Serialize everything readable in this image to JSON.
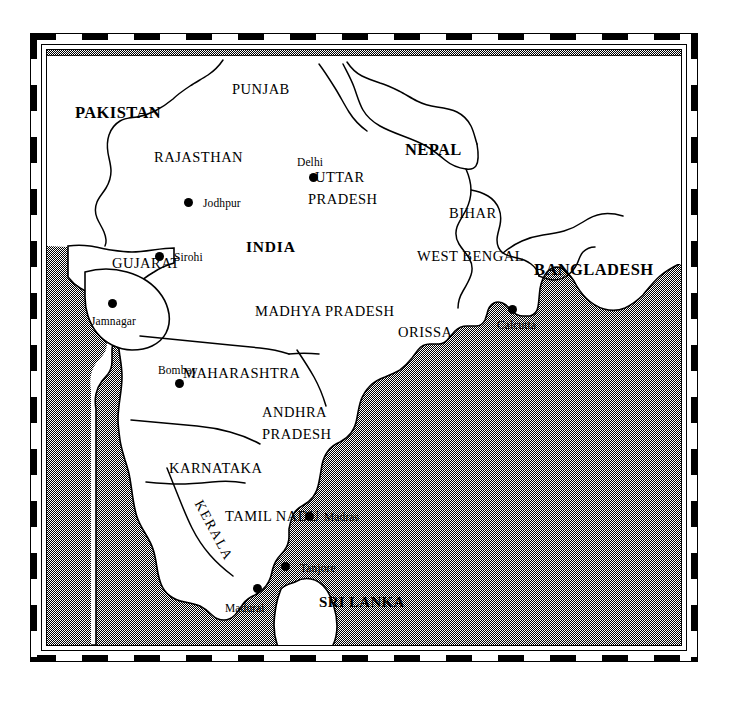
{
  "map": {
    "title": "Map of the Indian Subcontinent",
    "sea_fill_hex": "#808080",
    "land_fill_hex": "#ffffff",
    "outline_hex": "#000000",
    "frame_hex": "#000000",
    "countries": [
      {
        "name": "PAKISTAN",
        "x": 28,
        "y": 55,
        "style": "country"
      },
      {
        "name": "NEPAL",
        "x": 358,
        "y": 92,
        "style": "country"
      },
      {
        "name": "BANGLADESH",
        "x": 487,
        "y": 212,
        "style": "country"
      },
      {
        "name": "SRI LANKA",
        "x": 272,
        "y": 545,
        "style": "country-sm"
      },
      {
        "name": "INDIA",
        "x": 199,
        "y": 189,
        "style": "india"
      }
    ],
    "states": [
      {
        "name": "PUNJAB",
        "x": 185,
        "y": 32
      },
      {
        "name": "RAJASTHAN",
        "x": 107,
        "y": 100
      },
      {
        "name": "UTTAR",
        "x": 268,
        "y": 120
      },
      {
        "name": "PRADESH",
        "x": 261,
        "y": 142
      },
      {
        "name": "BIHAR",
        "x": 402,
        "y": 156
      },
      {
        "name": "WEST BENGAL",
        "x": 370,
        "y": 199
      },
      {
        "name": "GUJARAT",
        "x": 65,
        "y": 206
      },
      {
        "name": "MADHYA PRADESH",
        "x": 208,
        "y": 254
      },
      {
        "name": "ORISSA",
        "x": 351,
        "y": 275
      },
      {
        "name": "MAHARASHTRA",
        "x": 136,
        "y": 316
      },
      {
        "name": "ANDHRA",
        "x": 215,
        "y": 355
      },
      {
        "name": "PRADESH",
        "x": 215,
        "y": 377
      },
      {
        "name": "KARNATAKA",
        "x": 122,
        "y": 411
      },
      {
        "name": "TAMIL NADU",
        "x": 178,
        "y": 459
      }
    ],
    "rotated_states": [
      {
        "name": "KERALA",
        "x": 157,
        "y": 448,
        "rotate_deg": 62
      }
    ],
    "cities": [
      {
        "name": "Delhi",
        "dot_x": 266,
        "dot_y": 127,
        "label_x": 250,
        "label_y": 107
      },
      {
        "name": "Jodhpur",
        "dot_x": 141,
        "dot_y": 152,
        "label_x": 156,
        "label_y": 148
      },
      {
        "name": "Sirohi",
        "dot_x": 112,
        "dot_y": 206,
        "label_x": 127,
        "label_y": 202
      },
      {
        "name": "Jamnagar",
        "dot_x": 65,
        "dot_y": 253,
        "label_x": 44,
        "label_y": 266
      },
      {
        "name": "Bombay",
        "dot_x": 132,
        "dot_y": 333,
        "label_x": 111,
        "label_y": 315
      },
      {
        "name": "Calcutta",
        "dot_x": 465,
        "dot_y": 259,
        "label_x": 450,
        "label_y": 270
      },
      {
        "name": "Madras",
        "dot_x": 262,
        "dot_y": 466,
        "label_x": 277,
        "label_y": 462
      },
      {
        "name": "Tanjore",
        "dot_x": 238,
        "dot_y": 516,
        "label_x": 253,
        "label_y": 513
      },
      {
        "name": "Madurai",
        "dot_x": 210,
        "dot_y": 538,
        "label_x": 178,
        "label_y": 553
      },
      {
        "name": "Colombo",
        "dot_x": 246,
        "dot_y": 601,
        "label_x": 187,
        "label_y": 598
      },
      {
        "name": "Kandy",
        "dot_x": 268,
        "dot_y": 606,
        "label_x": 284,
        "label_y": 604
      }
    ]
  }
}
